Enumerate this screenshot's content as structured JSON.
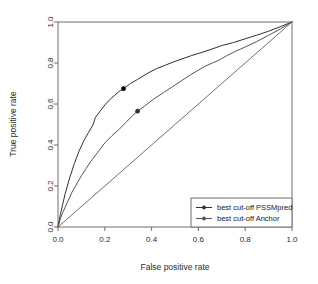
{
  "chart_data": {
    "type": "line",
    "title": "",
    "xlabel": "False positive rate",
    "ylabel": "True positive rate",
    "xlim": [
      0.0,
      1.0
    ],
    "ylim": [
      0.0,
      1.0
    ],
    "grid": false,
    "legend_position": "bottom-right",
    "xticks": [
      "0.0",
      "0.2",
      "0.4",
      "0.6",
      "0.8",
      "1.0"
    ],
    "xtick_values": [
      0.0,
      0.2,
      0.4,
      0.6,
      0.8,
      1.0
    ],
    "yticks": [
      "0.0",
      "0.2",
      "0.4",
      "0.6",
      "0.8",
      "1.0"
    ],
    "ytick_values": [
      0.0,
      0.2,
      0.4,
      0.6,
      0.8,
      1.0
    ],
    "series": [
      {
        "name": "PSSMpred",
        "legend_label": "best cut-off PSSMpred",
        "color": "#303030",
        "marker_color": "#000000",
        "marker_point": {
          "x": 0.28,
          "y": 0.675
        },
        "x": [
          0.0,
          0.01,
          0.02,
          0.03,
          0.05,
          0.07,
          0.09,
          0.11,
          0.13,
          0.15,
          0.16,
          0.18,
          0.2,
          0.22,
          0.24,
          0.26,
          0.28,
          0.31,
          0.34,
          0.38,
          0.42,
          0.46,
          0.5,
          0.53,
          0.57,
          0.61,
          0.65,
          0.7,
          0.75,
          0.8,
          0.85,
          0.9,
          0.95,
          1.0
        ],
        "y": [
          0.0,
          0.06,
          0.11,
          0.16,
          0.24,
          0.31,
          0.37,
          0.42,
          0.46,
          0.5,
          0.535,
          0.565,
          0.595,
          0.62,
          0.64,
          0.66,
          0.675,
          0.7,
          0.72,
          0.748,
          0.772,
          0.79,
          0.808,
          0.82,
          0.836,
          0.85,
          0.865,
          0.885,
          0.9,
          0.918,
          0.936,
          0.955,
          0.977,
          1.0
        ]
      },
      {
        "name": "Anchor",
        "legend_label": "best cut-off Anchor",
        "color": "#555555",
        "marker_color": "#333333",
        "marker_point": {
          "x": 0.34,
          "y": 0.565
        },
        "x": [
          0.0,
          0.01,
          0.02,
          0.04,
          0.06,
          0.08,
          0.1,
          0.12,
          0.14,
          0.17,
          0.2,
          0.23,
          0.26,
          0.29,
          0.32,
          0.34,
          0.37,
          0.41,
          0.45,
          0.49,
          0.53,
          0.57,
          0.6,
          0.63,
          0.66,
          0.69,
          0.72,
          0.76,
          0.8,
          0.85,
          0.9,
          0.95,
          1.0
        ],
        "y": [
          0.0,
          0.04,
          0.07,
          0.12,
          0.17,
          0.21,
          0.25,
          0.285,
          0.32,
          0.365,
          0.41,
          0.445,
          0.475,
          0.51,
          0.545,
          0.565,
          0.59,
          0.625,
          0.655,
          0.685,
          0.715,
          0.745,
          0.765,
          0.785,
          0.8,
          0.815,
          0.835,
          0.858,
          0.878,
          0.905,
          0.935,
          0.966,
          1.0
        ]
      },
      {
        "name": "reference-diagonal",
        "legend_label": "",
        "color": "#707070",
        "x": [
          0.0,
          1.0
        ],
        "y": [
          0.0,
          1.0
        ]
      }
    ],
    "legend_entries": [
      {
        "label": "best cut-off PSSMpred",
        "color": "#303030",
        "marker": "filled-circle"
      },
      {
        "label": "best cut-off Anchor",
        "color": "#555555",
        "marker": "filled-circle"
      }
    ]
  }
}
